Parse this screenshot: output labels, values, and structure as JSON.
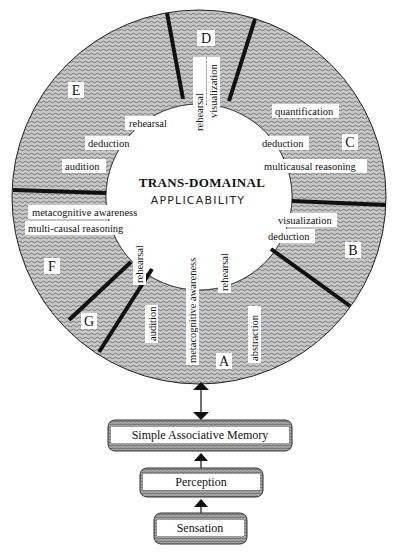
{
  "center": {
    "title": "TRANS-DOMAINAL",
    "subtitle": "APPLICABILITY"
  },
  "sectors": [
    {
      "id": "A",
      "letter": "A",
      "labels": [
        "audition",
        "metacognitive awareness",
        "rehearsal",
        "abstraction"
      ]
    },
    {
      "id": "B",
      "letter": "B",
      "labels": [
        "visualization",
        "deduction"
      ]
    },
    {
      "id": "C",
      "letter": "C",
      "labels": [
        "quantification",
        "deduction",
        "multicausal reasoning"
      ]
    },
    {
      "id": "D",
      "letter": "D",
      "labels": [
        "rehearsal",
        "visualization"
      ]
    },
    {
      "id": "E",
      "letter": "E",
      "labels": [
        "rehearsal",
        "deduction",
        "audition"
      ]
    },
    {
      "id": "F",
      "letter": "F",
      "labels": [
        "metacognitive awareness",
        "multi-causal reasoning",
        "rehearsal"
      ]
    },
    {
      "id": "G",
      "letter": "G",
      "labels": []
    }
  ],
  "hierarchy": [
    {
      "label": "Simple Associative Memory"
    },
    {
      "label": "Perception"
    },
    {
      "label": "Sensation"
    }
  ],
  "colors": {
    "ring_fill": "#bdbdbd",
    "ring_wave": "#6e6e6e",
    "divider": "#111111",
    "label_bg": "#ffffff",
    "box_fill": "#9a9a9a"
  }
}
